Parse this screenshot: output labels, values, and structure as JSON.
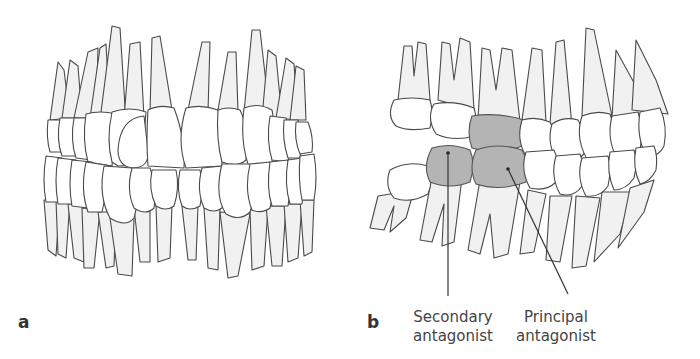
{
  "figure": {
    "panels": [
      {
        "id": "a",
        "letter": "a",
        "view": "frontal view of permanent dentition in occlusion"
      },
      {
        "id": "b",
        "letter": "b",
        "view": "lateral view of dentition showing antagonist teeth",
        "labels": [
          {
            "line1": "Secondary",
            "line2": "antagonist"
          },
          {
            "line1": "Principal",
            "line2": "antagonist"
          }
        ]
      }
    ],
    "colors": {
      "outline": "#4a4a4a",
      "tooth_fill": "#ffffff",
      "root_fill": "#f1f1f1",
      "antagonist_fill": "#b4b4b4",
      "text": "#444444"
    }
  }
}
